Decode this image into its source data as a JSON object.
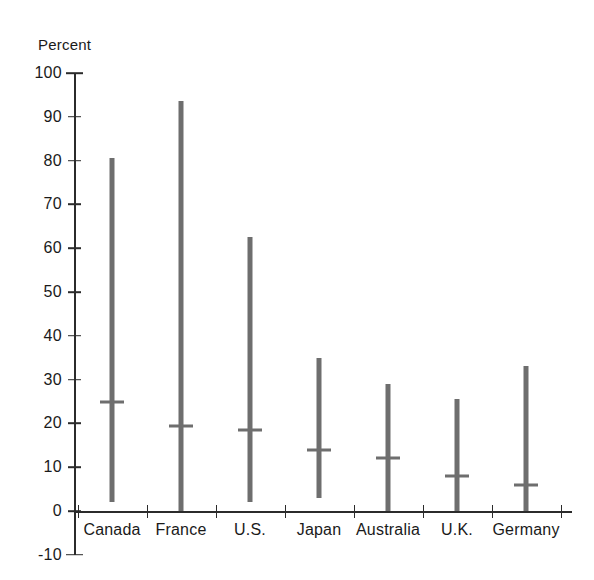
{
  "chart_data": {
    "type": "bar",
    "subtype": "range-bar-with-median",
    "title": "",
    "xlabel": "",
    "ylabel": "Percent",
    "ylim": [
      -10,
      100
    ],
    "ytick_step": 10,
    "yticks": [
      100,
      90,
      80,
      70,
      60,
      50,
      40,
      30,
      20,
      10,
      0,
      -10
    ],
    "ytick_labels": [
      "100",
      "90",
      "80",
      "70",
      "60",
      "50",
      "40",
      "30",
      "20",
      "10",
      "0",
      "-10"
    ],
    "grid": false,
    "legend": null,
    "categories": [
      "Canada",
      "France",
      "U.S.",
      "Japan",
      "Australia",
      "U.K.",
      "Germany"
    ],
    "series": [
      {
        "name": "range_low",
        "values": [
          2.0,
          0.0,
          2.0,
          3.0,
          0.0,
          0.0,
          0.0
        ]
      },
      {
        "name": "range_high",
        "values": [
          80.5,
          93.5,
          62.5,
          35.0,
          29.0,
          25.5,
          33.0
        ]
      },
      {
        "name": "median",
        "values": [
          25.0,
          19.5,
          18.5,
          14.0,
          12.0,
          8.0,
          6.0
        ]
      }
    ],
    "colors": {
      "bar": "#6e6e6e",
      "axis": "#2b2b2b",
      "text": "#1a1a1a",
      "background": "#ffffff"
    }
  },
  "axes": {
    "y_unit_label": "Percent"
  }
}
